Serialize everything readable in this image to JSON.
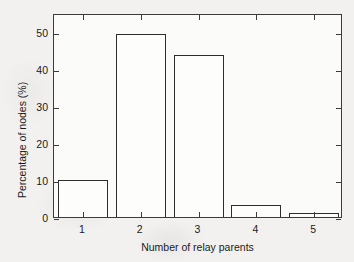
{
  "chart_data": {
    "type": "bar",
    "title": "",
    "xlabel": "Number of relay parents",
    "ylabel": "Percentage of nodes (%)",
    "categories": [
      "1",
      "2",
      "3",
      "4",
      "5"
    ],
    "values": [
      10.0,
      49.3,
      43.7,
      3.2,
      1.0
    ],
    "xtick_labels": [
      "1",
      "2",
      "3",
      "4",
      "5"
    ],
    "ytick_labels": [
      "0",
      "10",
      "20",
      "30",
      "40",
      "50"
    ],
    "ytick_values": [
      0,
      10,
      20,
      30,
      40,
      50
    ],
    "ylim": [
      0,
      55
    ],
    "xlim": [
      0.5,
      5.5
    ],
    "grid": false,
    "legend": null,
    "bar_face_color": "#ffffff",
    "bar_edge_color": "#000000",
    "axes_color": "#000000",
    "background_color": "#f2f1ef"
  }
}
